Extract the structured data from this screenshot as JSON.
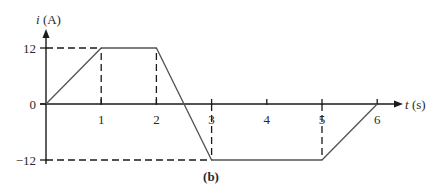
{
  "chart_data": {
    "type": "line",
    "title": "",
    "caption": "(b)",
    "xlabel": "t (s)",
    "ylabel": "i (A)",
    "xlabel_var": "t",
    "xlabel_unit": "(s)",
    "ylabel_var": "i",
    "ylabel_unit": "(A)",
    "x_ticks": [
      1,
      2,
      3,
      4,
      5,
      6
    ],
    "y_ticks": [
      12,
      0,
      -12
    ],
    "y_tick_labels": [
      "12",
      "0",
      "−12"
    ],
    "xlim": [
      0,
      6.5
    ],
    "ylim": [
      -12,
      12
    ],
    "grid": false,
    "series": [
      {
        "name": "i(t)",
        "x": [
          0,
          1,
          2,
          3,
          5,
          6
        ],
        "y": [
          0,
          12,
          12,
          -12,
          -12,
          0
        ]
      }
    ],
    "guides": {
      "horizontal_dashed": [
        12,
        -12
      ],
      "vertical_dashed": [
        1,
        2,
        3,
        5
      ]
    },
    "colors": {
      "line": "#555555",
      "axis": "#1a1a1a",
      "text": "#2a2a2a"
    }
  }
}
